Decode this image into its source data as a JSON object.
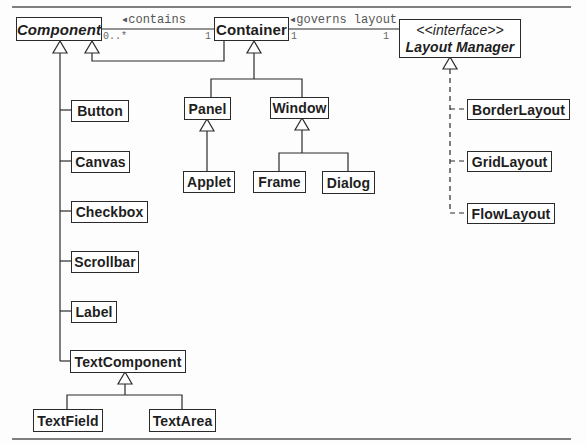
{
  "diagram": {
    "type": "UML class diagram",
    "classes": {
      "component": {
        "label": "Component",
        "abstract": true
      },
      "container": {
        "label": "Container"
      },
      "layout_manager": {
        "stereotype": "<<interface>>",
        "label": "Layout Manager"
      },
      "button": {
        "label": "Button"
      },
      "canvas": {
        "label": "Canvas"
      },
      "checkbox": {
        "label": "Checkbox"
      },
      "scrollbar": {
        "label": "Scrollbar"
      },
      "label": {
        "label": "Label"
      },
      "text_component": {
        "label": "TextComponent"
      },
      "text_field": {
        "label": "TextField"
      },
      "text_area": {
        "label": "TextArea"
      },
      "panel": {
        "label": "Panel"
      },
      "window": {
        "label": "Window"
      },
      "applet": {
        "label": "Applet"
      },
      "frame": {
        "label": "Frame"
      },
      "dialog": {
        "label": "Dialog"
      },
      "border_layout": {
        "label": "BorderLayout"
      },
      "grid_layout": {
        "label": "GridLayout"
      },
      "flow_layout": {
        "label": "FlowLayout"
      }
    },
    "associations": {
      "contains": {
        "label": "◂contains",
        "from": "Container",
        "to": "Component",
        "mult_component": "0..*",
        "mult_container": "1"
      },
      "governs_layout": {
        "label": "◂governs layout",
        "from": "Layout Manager",
        "to": "Container",
        "mult_container": "1",
        "mult_layout_manager": "1"
      }
    },
    "generalizations": [
      {
        "child": "Button",
        "parent": "Component"
      },
      {
        "child": "Canvas",
        "parent": "Component"
      },
      {
        "child": "Checkbox",
        "parent": "Component"
      },
      {
        "child": "Scrollbar",
        "parent": "Component"
      },
      {
        "child": "Label",
        "parent": "Component"
      },
      {
        "child": "TextComponent",
        "parent": "Component"
      },
      {
        "child": "Container",
        "parent": "Component"
      },
      {
        "child": "TextField",
        "parent": "TextComponent"
      },
      {
        "child": "TextArea",
        "parent": "TextComponent"
      },
      {
        "child": "Panel",
        "parent": "Container"
      },
      {
        "child": "Window",
        "parent": "Container"
      },
      {
        "child": "Applet",
        "parent": "Panel"
      },
      {
        "child": "Frame",
        "parent": "Window"
      },
      {
        "child": "Dialog",
        "parent": "Window"
      }
    ],
    "realizations": [
      {
        "class": "BorderLayout",
        "interface": "Layout Manager"
      },
      {
        "class": "GridLayout",
        "interface": "Layout Manager"
      },
      {
        "class": "FlowLayout",
        "interface": "Layout Manager"
      }
    ]
  },
  "colors": {
    "line": "#2a2a2a",
    "box_border": "#2a2a2a",
    "text": "#1e1e1e",
    "assoc_text": "#555555",
    "background": "#fdfdfd"
  }
}
